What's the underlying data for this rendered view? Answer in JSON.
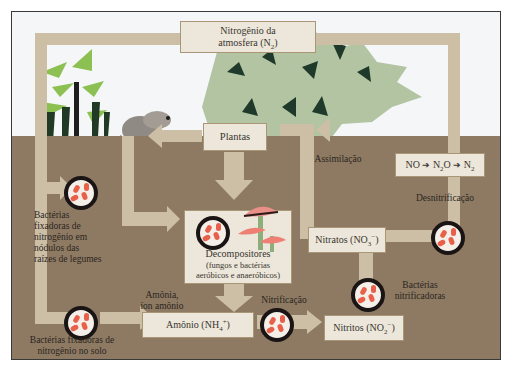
{
  "diagram": {
    "colors": {
      "sky": "#f5f6f8",
      "soil": "#8e7a63",
      "arrow_band": "#cdbfa6",
      "box_fill": "#ece7da",
      "bacteria_ring": "#1a1514",
      "bacteria_cell": "#e8604a",
      "foliage_light": "#b3c4a2",
      "foliage_dark": "#1f3a2a"
    },
    "nodes": {
      "atmosphere": {
        "line1": "Nitrogênio da",
        "line2": "atmosfera (N",
        "sub": "2",
        "close": ")"
      },
      "plants": {
        "label": "Plantas"
      },
      "decomposers": {
        "title": "Decompositores",
        "line1": "(fungos e bactérias",
        "line2": "aeróbicos e anaeróbicos)"
      },
      "ammonium": {
        "label": "Amônio (NH",
        "sub": "4",
        "sup": "+",
        "close": ")"
      },
      "nitrites": {
        "label": "Nitritos (NO",
        "sub": "2",
        "sup": "−",
        "close": ")"
      },
      "nitrates": {
        "label": "Nitratos (NO",
        "sub": "3",
        "sup": "−",
        "close": ")"
      },
      "denitrification_chain": {
        "a": "NO",
        "arrow": "➔",
        "b": "N",
        "b_sub": "2",
        "b_tail": "O",
        "c": "N",
        "c_sub": "2"
      }
    },
    "labels": {
      "legume_bacteria": [
        "Bactérias",
        "fixadoras de",
        "nitrogênio em",
        "nódulos das",
        "raízes de legumes"
      ],
      "soil_bacteria": [
        "Bactérias fixadoras de",
        "nitrogênio no solo"
      ],
      "ammonia": [
        "Amônia,",
        "íon amônio"
      ],
      "nitrification": "Nitrificação",
      "nitrifying_bacteria": [
        "Bactérias",
        "nitrificadoras"
      ],
      "assimilation": "Assimilação",
      "denitrification": "Desnitrificação"
    }
  }
}
